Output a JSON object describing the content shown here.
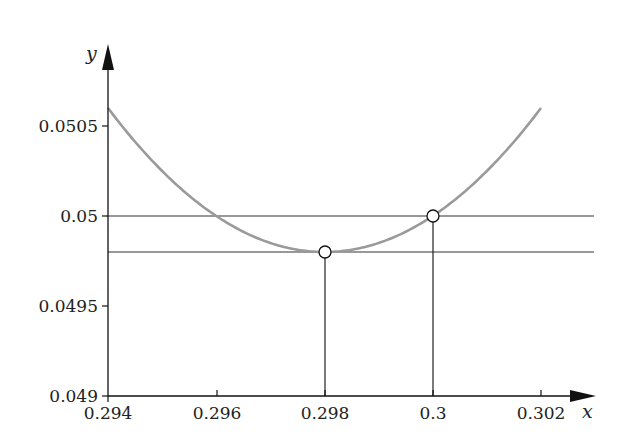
{
  "chart_data": {
    "type": "line",
    "title": "",
    "xlabel": "x",
    "ylabel": "y",
    "xlim": [
      0.294,
      0.303
    ],
    "ylim": [
      0.049,
      0.0508
    ],
    "grid": false,
    "legend": null,
    "x_ticks": [
      "0.294",
      "0.296",
      "0.298",
      "0.3",
      "0.302"
    ],
    "y_ticks": [
      "0.049",
      "0.0495",
      "0.05",
      "0.0505"
    ],
    "series": [
      {
        "name": "curve",
        "style": "gray parabola",
        "color": "#9a9a9a",
        "x": [
          0.294,
          0.295,
          0.296,
          0.297,
          0.298,
          0.299,
          0.3,
          0.301,
          0.302
        ],
        "values": [
          0.0506,
          0.04025,
          0.05,
          0.04985,
          0.0498,
          0.04985,
          0.05,
          0.04025,
          0.0506
        ]
      }
    ],
    "curve_formula": "y = 0.0498 + 50*(x - 0.298)^2",
    "horizontal_lines": [
      {
        "y": 0.05,
        "color": "#333333"
      },
      {
        "y": 0.0498,
        "color": "#333333"
      }
    ],
    "vertical_lines": [
      {
        "x": 0.298,
        "from_y": 0.049,
        "to_y": 0.0498
      },
      {
        "x": 0.3,
        "from_y": 0.049,
        "to_y": 0.05
      }
    ],
    "markers": [
      {
        "x": 0.298,
        "y": 0.0498,
        "style": "open circle"
      },
      {
        "x": 0.3,
        "y": 0.05,
        "style": "open circle"
      }
    ]
  },
  "labels": {
    "x_axis": "x",
    "y_axis": "y",
    "x_ticks": [
      "0.294",
      "0.296",
      "0.298",
      "0.3",
      "0.302"
    ],
    "y_ticks": [
      "0.049",
      "0.0495",
      "0.05",
      "0.0505"
    ]
  }
}
